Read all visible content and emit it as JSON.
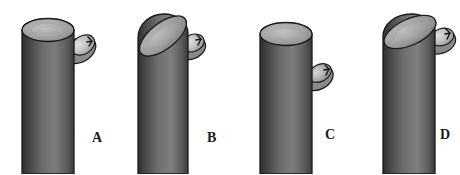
{
  "figure": {
    "title": "",
    "background_color": "#ffffff",
    "width": 460,
    "height": 174,
    "panel_count": 4
  },
  "colors": {
    "outline": "#1a1a1a",
    "body_dark": "#3b3b3b",
    "body_mid": "#6e6e6e",
    "body_light": "#8f8f8f",
    "top_dark": "#707070",
    "top_light": "#b9b9b9",
    "bud_light": "#d8d8d8",
    "bud_mid": "#a8a8a8",
    "bud_dark": "#4a4a4a",
    "label_color": "#1a1a1a",
    "background": "#ffffff"
  },
  "panels": [
    {
      "id": "a",
      "label": "A",
      "label_x": 92,
      "label_y": 138,
      "stem": {
        "top_style": "flat-horizontal",
        "left": 22,
        "right": 74,
        "top_y": 18,
        "bottom_y": 174
      },
      "bud": {
        "position": "upper-right",
        "attach_level": "just-below-apex",
        "center_x": 81,
        "center_y": 48,
        "tilt_deg": -32
      }
    },
    {
      "id": "b",
      "label": "B",
      "label_x": 207,
      "label_y": 138,
      "stem": {
        "top_style": "oblique-slanted",
        "left": 138,
        "right": 188,
        "top_y": 14,
        "bottom_y": 174
      },
      "bud": {
        "position": "upper-right",
        "attach_level": "at-apex",
        "center_x": 191,
        "center_y": 45,
        "tilt_deg": -22
      }
    },
    {
      "id": "c",
      "label": "C",
      "label_x": 325,
      "label_y": 135,
      "stem": {
        "top_style": "flat-horizontal",
        "left": 260,
        "right": 312,
        "top_y": 22,
        "bottom_y": 174
      },
      "bud": {
        "position": "mid-right",
        "attach_level": "lower-on-stem",
        "center_x": 319,
        "center_y": 76,
        "tilt_deg": -28
      }
    },
    {
      "id": "d",
      "label": "D",
      "label_x": 440,
      "label_y": 135,
      "stem": {
        "top_style": "oblique-slanted",
        "left": 383,
        "right": 435,
        "top_y": 18,
        "bottom_y": 174
      },
      "bud": {
        "position": "upper-right",
        "attach_level": "at-apex",
        "center_x": 441,
        "center_y": 38,
        "tilt_deg": -20
      }
    }
  ]
}
